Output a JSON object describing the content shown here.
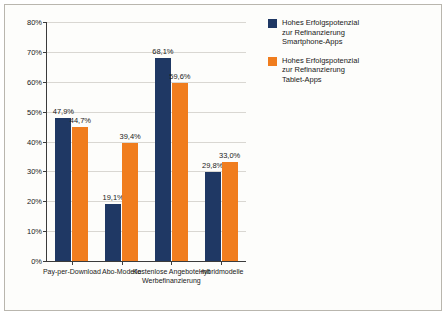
{
  "chart_data": {
    "type": "bar",
    "title": "",
    "xlabel": "",
    "ylabel": "",
    "ylim": [
      0,
      80
    ],
    "ytick_labels": [
      "0%",
      "10%",
      "20%",
      "30%",
      "40%",
      "50%",
      "60%",
      "70%",
      "80%"
    ],
    "ytick_values": [
      0,
      10,
      20,
      30,
      40,
      50,
      60,
      70,
      80
    ],
    "grid": true,
    "legend_position": "right",
    "categories": [
      "Pay-per-Download",
      "Abo-Modelle",
      "Kostenlose Angebote mit Werbefinanzierung",
      "Hybridmodelle"
    ],
    "series": [
      {
        "name": "Hohes Erfolgspotenzial zur Refinanzierung Smartphone-Apps",
        "color": "#1f3864",
        "values": [
          47.9,
          19.1,
          68.1,
          29.8
        ],
        "labels": [
          "47,9%",
          "19,1%",
          "68,1%",
          "29,8%"
        ]
      },
      {
        "name": "Hohes Erfolgspotenzial zur Refinanzierung Tablet-Apps",
        "color": "#f07d1e",
        "values": [
          44.7,
          39.4,
          59.6,
          33.0
        ],
        "labels": [
          "44,7%",
          "39,4%",
          "59,6%",
          "33,0%"
        ]
      }
    ]
  },
  "legend": {
    "items": [
      {
        "color": "#1f3864",
        "line1": "Hohes Erfolgspotenzial",
        "line2": "zur Refinanzierung",
        "line3": "Smartphone-Apps"
      },
      {
        "color": "#f07d1e",
        "line1": "Hohes Erfolgspotenzial",
        "line2": "zur Refinanzierung",
        "line3": "Tablet-Apps"
      }
    ]
  }
}
